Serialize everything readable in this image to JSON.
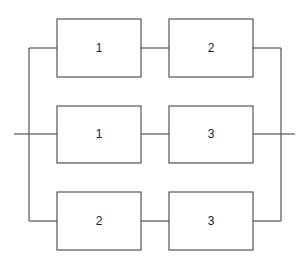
{
  "diagram": {
    "type": "reliability-block-diagram",
    "paths": [
      {
        "blocks": [
          {
            "label": "1"
          },
          {
            "label": "2"
          }
        ]
      },
      {
        "blocks": [
          {
            "label": "1"
          },
          {
            "label": "3"
          }
        ]
      },
      {
        "blocks": [
          {
            "label": "2"
          },
          {
            "label": "3"
          }
        ]
      }
    ]
  },
  "colors": {
    "line": "#555555",
    "text": "#222222",
    "background": "#ffffff"
  }
}
